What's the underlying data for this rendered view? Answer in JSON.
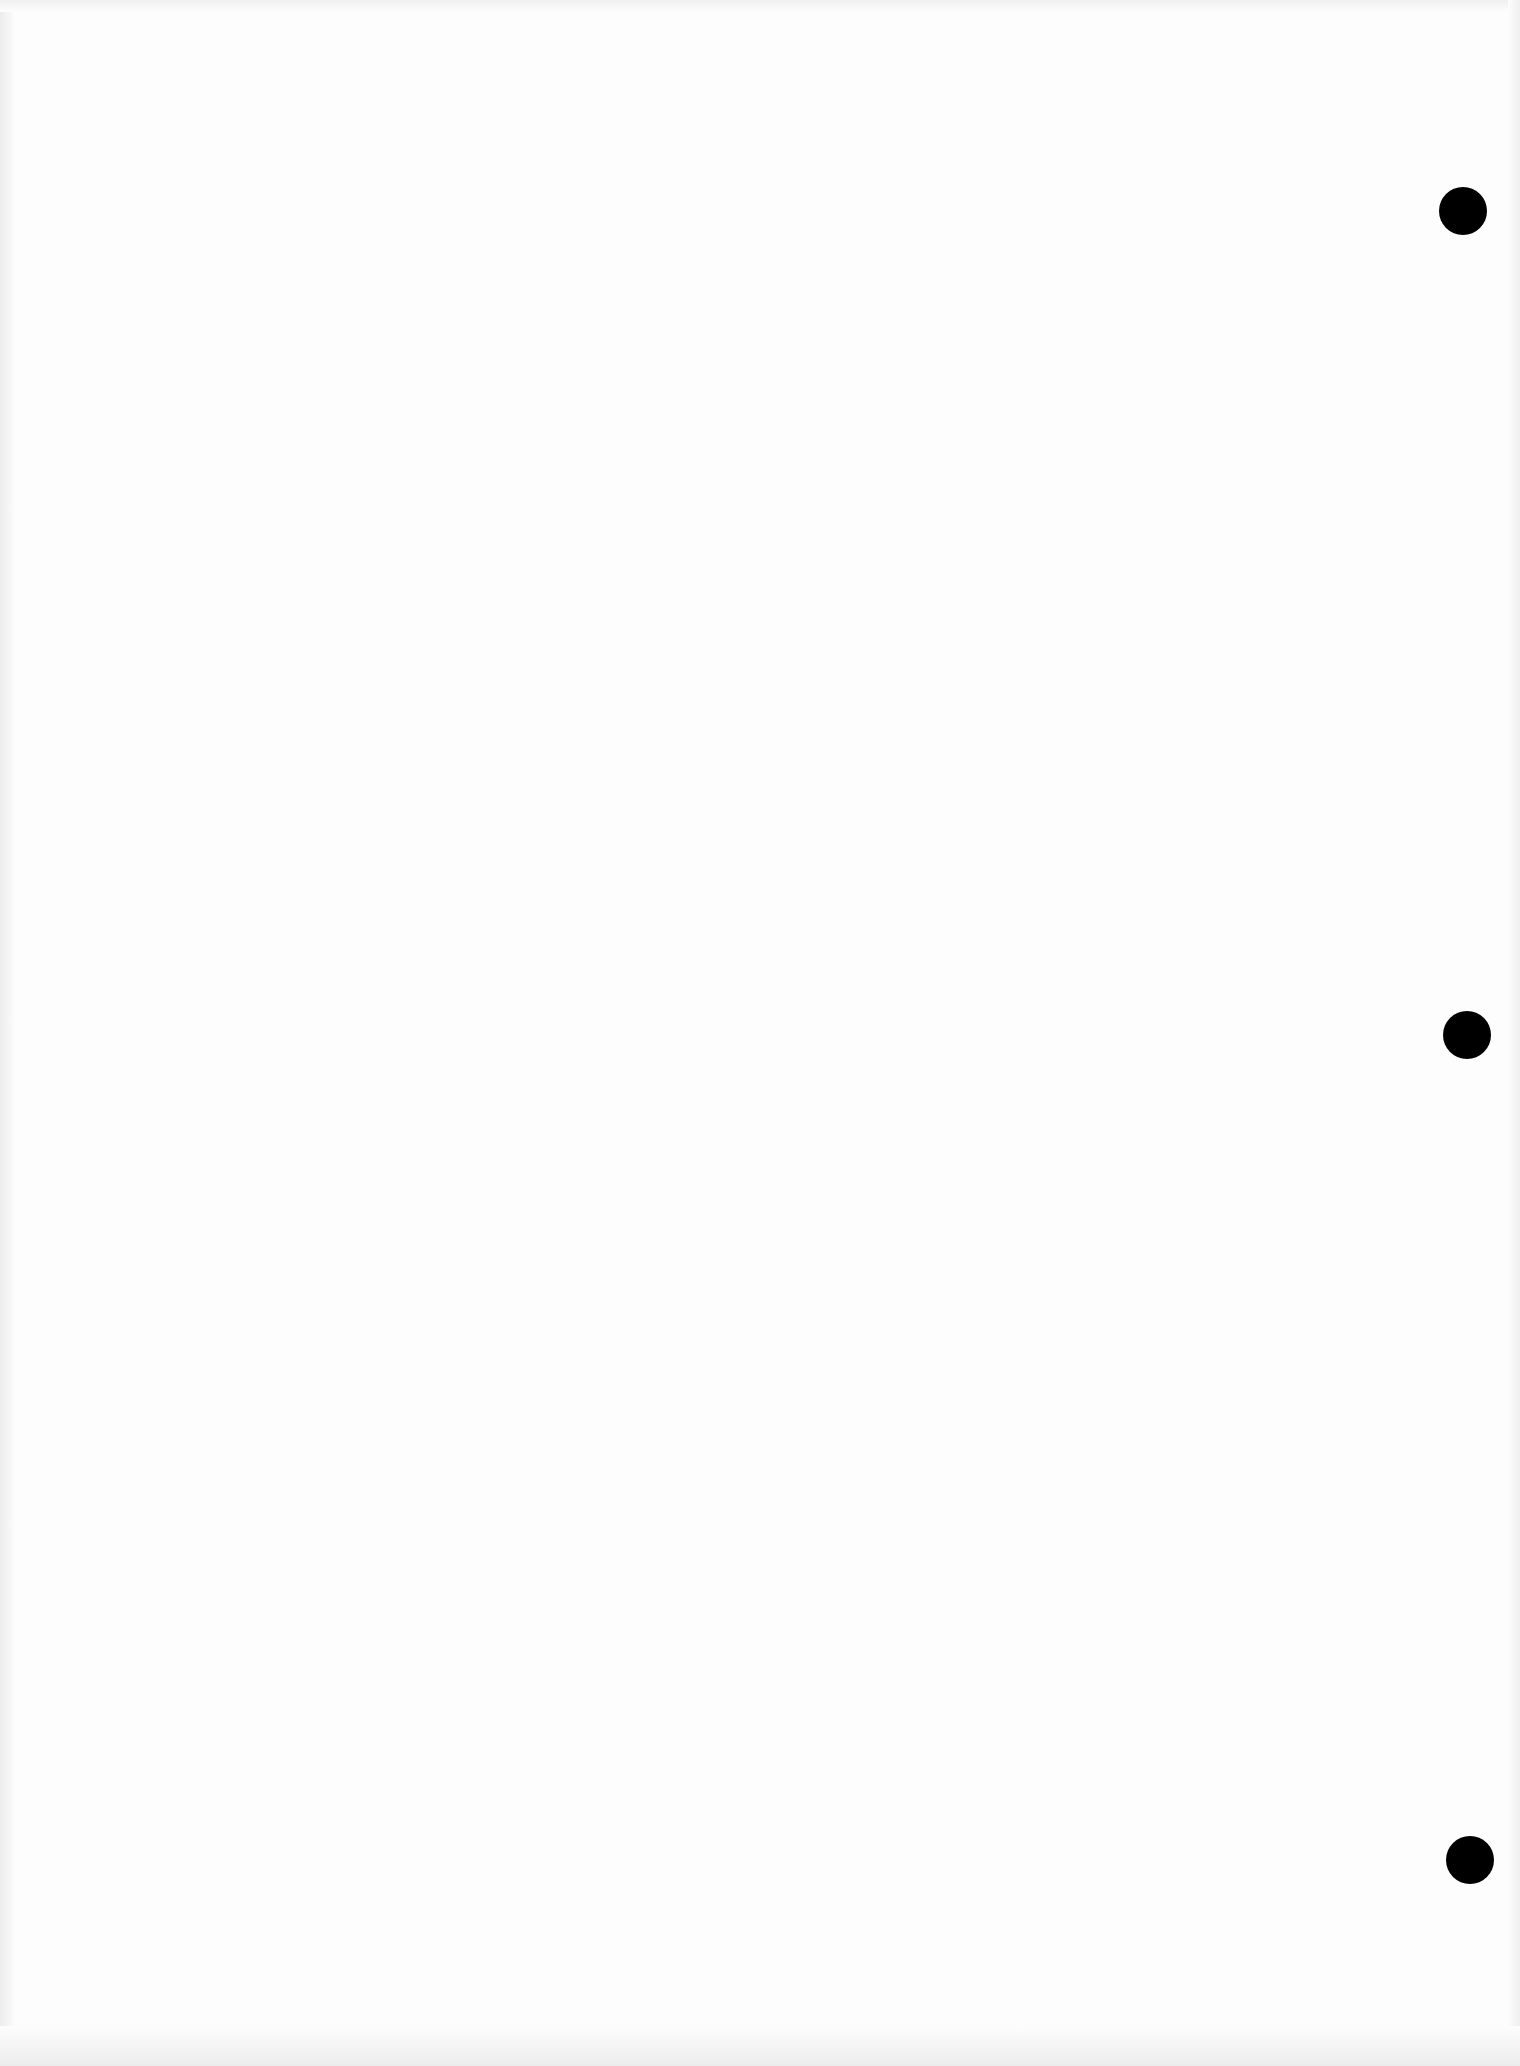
{
  "page": {
    "background": "#fdfdfd",
    "content_text": "",
    "punch_holes": [
      {
        "cx": 1463,
        "cy": 211,
        "diameter": 48,
        "color": "#000000"
      },
      {
        "cx": 1467,
        "cy": 1035,
        "diameter": 48,
        "color": "#000000"
      },
      {
        "cx": 1470,
        "cy": 1860,
        "diameter": 48,
        "color": "#000000"
      }
    ]
  }
}
